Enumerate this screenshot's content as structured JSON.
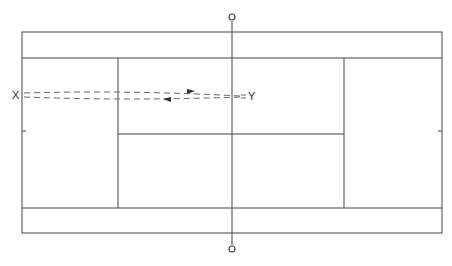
{
  "diagram": {
    "type": "tennis-court-top-view",
    "labels": {
      "start_point": "X",
      "end_point": "Y"
    },
    "elements": {
      "net_post_top": "net post",
      "net_post_bottom": "net post",
      "path_forward": "X to Y",
      "path_return": "Y to X"
    },
    "colors": {
      "line": "#444444",
      "dashed": "#666666",
      "background": "#ffffff"
    }
  }
}
